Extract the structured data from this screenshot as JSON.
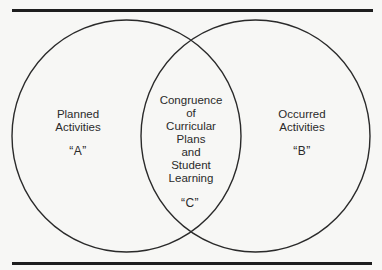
{
  "diagram": {
    "type": "venn",
    "sets": [
      {
        "id": "A",
        "lines": [
          "Planned",
          "Activities"
        ],
        "letter": "“A”"
      },
      {
        "id": "B",
        "lines": [
          "Occurred",
          "Activities"
        ],
        "letter": "“B”"
      }
    ],
    "intersection": {
      "id": "C",
      "lines": [
        "Congruence",
        "of",
        "Curricular",
        "Plans",
        "and",
        "Student",
        "Learning"
      ],
      "letter": "“C”"
    },
    "colors": {
      "background": "#f7f7f5",
      "stroke": "#2a2a2a",
      "rule": "#1e1e1e"
    }
  }
}
